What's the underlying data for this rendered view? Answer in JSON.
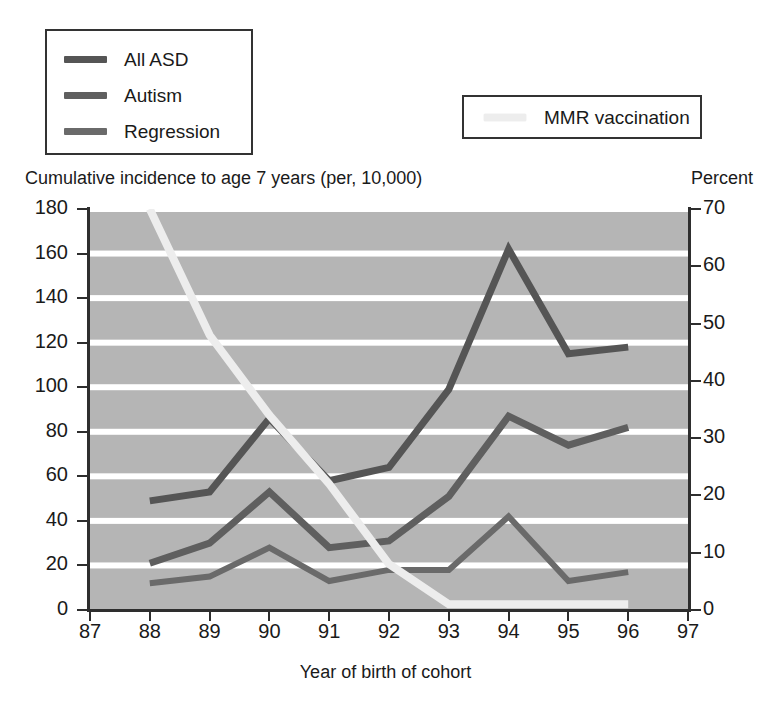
{
  "legend": {
    "series_box": [
      {
        "label": "All ASD",
        "color": "#555555",
        "icon": "line-swatch-icon"
      },
      {
        "label": "Autism",
        "color": "#5f5f5f",
        "icon": "line-swatch-icon"
      },
      {
        "label": "Regression",
        "color": "#6a6a6a",
        "icon": "line-swatch-icon"
      }
    ],
    "mmr_box": {
      "label": "MMR vaccination",
      "color": "#ededed",
      "icon": "line-swatch-icon"
    }
  },
  "axis_titles": {
    "left": "Cumulative incidence to age 7 years (per, 10,000)",
    "right": "Percent",
    "bottom": "Year of birth of cohort"
  },
  "colors": {
    "plot_background": "#b5b5b5",
    "gridline": "#ffffff",
    "axis": "#2e2e2e",
    "all_asd": "#555555",
    "autism": "#5f5f5f",
    "regression": "#6a6a6a",
    "mmr": "#ededed"
  },
  "chart_data": {
    "type": "line",
    "title": "",
    "subtitle": "",
    "xlabel": "Year of birth of cohort",
    "ylabel": "Cumulative incidence to age 7 years (per, 10,000)",
    "y2label": "Percent",
    "xlim": [
      87,
      97
    ],
    "ylim": [
      0,
      180
    ],
    "y2lim": [
      0,
      70
    ],
    "xticks": [
      87,
      88,
      89,
      90,
      91,
      92,
      93,
      94,
      95,
      96,
      97
    ],
    "yticks": [
      0,
      20,
      40,
      60,
      80,
      100,
      120,
      140,
      160,
      180
    ],
    "y2ticks": [
      0,
      10,
      20,
      30,
      40,
      50,
      60,
      70
    ],
    "grid": true,
    "grid_orientation": "horizontal",
    "legend_position": "top-left",
    "x": [
      88,
      89,
      90,
      91,
      92,
      93,
      94,
      95,
      96
    ],
    "series": [
      {
        "name": "All ASD",
        "axis": "left",
        "unit": "per 10,000",
        "values": [
          49,
          53,
          86,
          58,
          64,
          99,
          162,
          115,
          118
        ]
      },
      {
        "name": "Autism",
        "axis": "left",
        "unit": "per 10,000",
        "values": [
          21,
          30,
          53,
          28,
          31,
          51,
          87,
          74,
          82
        ]
      },
      {
        "name": "Regression",
        "axis": "left",
        "unit": "per 10,000",
        "values": [
          12,
          15,
          28,
          13,
          18,
          18,
          42,
          13,
          17
        ]
      },
      {
        "name": "MMR vaccination",
        "axis": "right",
        "unit": "percent",
        "x": [
          88,
          89,
          90,
          91,
          92,
          93,
          94,
          95,
          96
        ],
        "values": [
          70,
          48,
          34,
          22,
          8,
          1,
          1,
          1,
          1
        ]
      }
    ]
  }
}
